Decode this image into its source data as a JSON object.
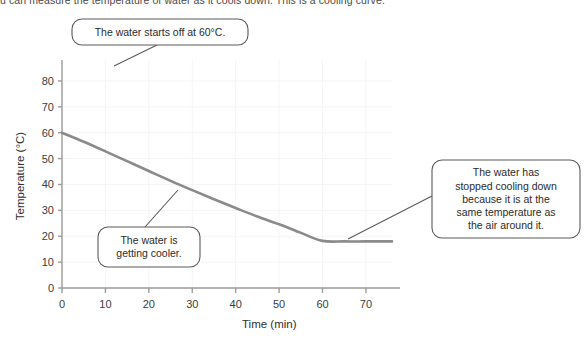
{
  "header": {
    "clipped_text": "u can measure the temperature of water as it cools down. This is a cooling curve."
  },
  "chart_data": {
    "type": "line",
    "title": "",
    "xlabel": "Time (min)",
    "ylabel": "Temperature (°C)",
    "xlim": [
      0,
      76
    ],
    "ylim": [
      0,
      85
    ],
    "xticks": [
      0,
      10,
      20,
      30,
      40,
      50,
      60,
      70
    ],
    "yticks": [
      0,
      10,
      20,
      30,
      40,
      50,
      60,
      70,
      80
    ],
    "grid": true,
    "legend": "none",
    "line_color": "#8a8a8a",
    "series": [
      {
        "name": "Cooling curve",
        "x": [
          0,
          5,
          10,
          15,
          20,
          25,
          30,
          35,
          40,
          45,
          50,
          55,
          60,
          65,
          70,
          76
        ],
        "y": [
          60,
          56.5,
          52.8,
          49.0,
          45.2,
          41.4,
          37.8,
          34.3,
          30.9,
          27.6,
          24.6,
          21.3,
          18.2,
          18.0,
          18.0,
          18.0
        ]
      }
    ],
    "annotations": [
      {
        "id": "start-temp",
        "text": "The water starts off at 60°C.",
        "lines": [
          "The water starts off at 60°C."
        ],
        "anchor_x": 0,
        "anchor_y": 60
      },
      {
        "id": "cooling",
        "text": "The water is getting cooler.",
        "lines": [
          "The water is",
          "getting cooler."
        ],
        "anchor_x": 25,
        "anchor_y": 37
      },
      {
        "id": "plateau",
        "text": "The water has stopped cooling down because it is at the same temperature as the air around it.",
        "lines": [
          "The water has",
          "stopped cooling down",
          "because it is at the",
          "same temperature as",
          "the air around it."
        ],
        "anchor_x": 61,
        "anchor_y": 18
      }
    ]
  },
  "colors": {
    "curve": "#8a8a8a",
    "axis": "#9b9b9b",
    "grid": "#f5f5f5",
    "callout_border": "#5a5a5a",
    "text": "#2b2b2b"
  }
}
